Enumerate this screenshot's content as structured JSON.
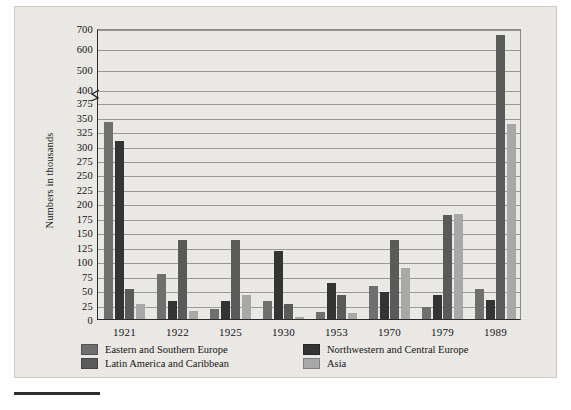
{
  "figure": {
    "ylabel": "Numbers in thousands",
    "background_color": "#eceae6"
  },
  "legend": {
    "items": [
      {
        "label": "Eastern and Southern Europe",
        "color": "#6f6f6f"
      },
      {
        "label": "Northwestern and Central Europe",
        "color": "#343434"
      },
      {
        "label": "Latin America and Caribbean",
        "color": "#5a5a5a"
      },
      {
        "label": "Asia",
        "color": "#a8a8a8"
      }
    ]
  },
  "chart_data": {
    "type": "bar",
    "title": "",
    "xlabel": "",
    "ylabel": "Numbers in thousands",
    "grid": true,
    "legend_position": "bottom-left",
    "axis_break": {
      "present": true,
      "between": [
        375,
        400
      ]
    },
    "ytick_labels": [
      "0",
      "25",
      "50",
      "75",
      "100",
      "125",
      "150",
      "175",
      "200",
      "225",
      "250",
      "275",
      "300",
      "325",
      "350",
      "375",
      "400",
      "500",
      "600",
      "700"
    ],
    "ytick_values": [
      0,
      25,
      50,
      75,
      100,
      125,
      150,
      175,
      200,
      225,
      250,
      275,
      300,
      325,
      350,
      375,
      400,
      500,
      600,
      700
    ],
    "ylim": [
      0,
      700
    ],
    "categories": [
      "1921",
      "1922",
      "1925",
      "1930",
      "1953",
      "1970",
      "1979",
      "1989"
    ],
    "series": [
      {
        "name": "Eastern and Southern Europe",
        "color": "#6f6f6f",
        "values": [
          341,
          78,
          17,
          32,
          13,
          57,
          20,
          52
        ]
      },
      {
        "name": "Northwestern and Central Europe",
        "color": "#343434",
        "values": [
          308,
          31,
          31,
          118,
          62,
          46,
          41,
          33
        ]
      },
      {
        "name": "Latin America and Caribbean",
        "color": "#5a5a5a",
        "values": [
          52,
          137,
          136,
          26,
          41,
          137,
          180,
          665
        ]
      },
      {
        "name": "Asia",
        "color": "#a8a8a8",
        "values": [
          26,
          14,
          41,
          3,
          11,
          88,
          182,
          337
        ]
      }
    ]
  }
}
